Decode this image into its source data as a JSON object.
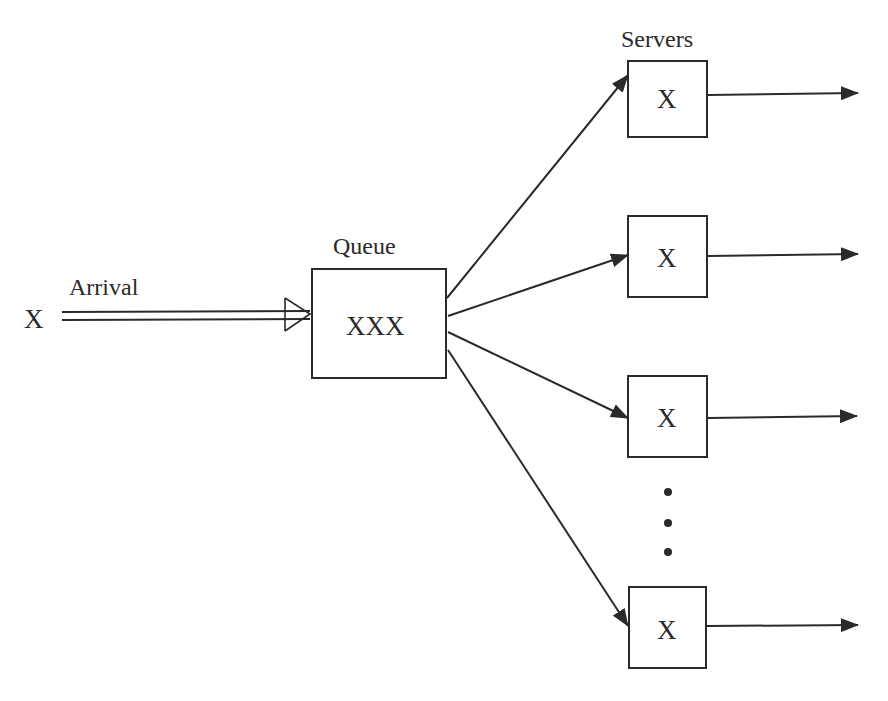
{
  "diagram": {
    "colors": {
      "line": "#2a2a2a",
      "background": "#ffffff"
    },
    "arrival": {
      "symbol": "X",
      "label": "Arrival"
    },
    "queue": {
      "label": "Queue",
      "content": "XXX"
    },
    "servers": {
      "label": "Servers",
      "items": [
        {
          "content": "X"
        },
        {
          "content": "X"
        },
        {
          "content": "X"
        },
        {
          "content": "X"
        }
      ],
      "ellipsis": "vertical-dots"
    }
  }
}
